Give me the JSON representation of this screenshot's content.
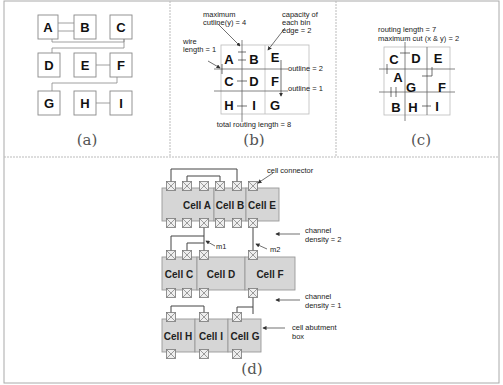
{
  "panels": {
    "a": {
      "caption": "(a)",
      "blocks": [
        "A",
        "B",
        "C",
        "D",
        "E",
        "F",
        "G",
        "H",
        "I"
      ]
    },
    "b": {
      "caption": "(b)",
      "annotations": {
        "max_cutline": "maximum",
        "max_cutline2": "cutline(y) = 4",
        "capacity1": "capacity of",
        "capacity2": "each bin",
        "capacity3": "edge = 2",
        "wire1": "wire",
        "wire2": "length = 1",
        "outline2": "outline = 2",
        "outline1": "outline = 1",
        "total": "total routing length = 8"
      },
      "grid": [
        [
          "A",
          "B",
          "E"
        ],
        [
          "C",
          "D",
          "F"
        ],
        [
          "H",
          "I",
          "G"
        ]
      ]
    },
    "c": {
      "caption": "(c)",
      "annotations": {
        "routing": "routing length = 7",
        "maxcut": "maximum cut (x & y) = 2"
      },
      "labels": [
        "C",
        "D",
        "E",
        "A",
        "G",
        "F",
        "B",
        "H",
        "I"
      ]
    },
    "d": {
      "caption": "(d)",
      "rows": [
        [
          "Cell A",
          "Cell B",
          "Cell E"
        ],
        [
          "Cell C",
          "Cell D",
          "Cell F"
        ],
        [
          "Cell H",
          "Cell I",
          "Cell G"
        ]
      ],
      "annotations": {
        "connector": "cell connector",
        "channel": "channel",
        "density2": "density = 2",
        "density1": "density = 1",
        "m1": "m1",
        "m2": "m2",
        "abut1": "cell abutment",
        "abut2": "box"
      }
    }
  },
  "colors": {
    "cell_fill": "#d6d6d6",
    "border": "#999999",
    "line": "#444444"
  }
}
